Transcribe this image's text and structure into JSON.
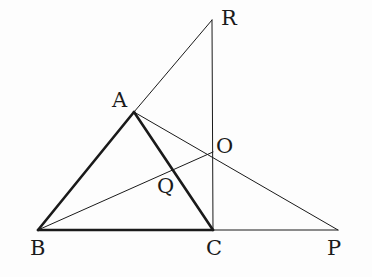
{
  "diagram": {
    "points": {
      "A": {
        "label": "A",
        "x": 134,
        "y": 112
      },
      "B": {
        "label": "B",
        "x": 38,
        "y": 230
      },
      "C": {
        "label": "C",
        "x": 213,
        "y": 230
      },
      "P": {
        "label": "P",
        "x": 338,
        "y": 230
      },
      "R": {
        "label": "R",
        "x": 212,
        "y": 20
      },
      "O": {
        "label": "O",
        "x": 213,
        "y": 152
      },
      "Q": {
        "label": "Q",
        "x": 172,
        "y": 169
      }
    },
    "thick_segments": [
      [
        "A",
        "B"
      ],
      [
        "B",
        "C"
      ],
      [
        "A",
        "C"
      ]
    ],
    "thin_segments": [
      [
        "A",
        "R"
      ],
      [
        "R",
        "C"
      ],
      [
        "A",
        "P"
      ],
      [
        "C",
        "P"
      ],
      [
        "B",
        "O"
      ]
    ],
    "stroke_color": "#1a1a1a"
  }
}
